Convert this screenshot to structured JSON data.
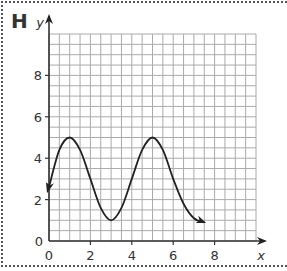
{
  "panel": {
    "label": "H"
  },
  "chart_data": {
    "type": "line",
    "title": "",
    "xlabel": "x",
    "ylabel": "y",
    "xlim": [
      0,
      10
    ],
    "ylim": [
      0,
      10
    ],
    "x_ticks": [
      "0",
      "2",
      "4",
      "6",
      "8"
    ],
    "y_ticks": [
      "0",
      "2",
      "4",
      "6",
      "8"
    ],
    "grid": true,
    "grid_step": 0.5,
    "series": [
      {
        "name": "curve",
        "description": "sinusoidal curve with arrows at both ends",
        "x": [
          0,
          0.5,
          1,
          1.5,
          2,
          2.5,
          3,
          3.5,
          4,
          4.5,
          5,
          5.5,
          6,
          6.5,
          7,
          7.5
        ],
        "y": [
          2.6,
          4.4,
          5,
          4.4,
          3,
          1.6,
          1,
          1.6,
          3,
          4.4,
          5,
          4.4,
          3,
          1.8,
          1.1,
          0.9
        ],
        "start_arrow": true,
        "end_arrow": true
      }
    ]
  }
}
